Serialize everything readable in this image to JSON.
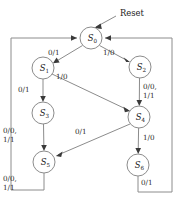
{
  "diagram": {
    "title": "Reset",
    "type": "finite-state-machine",
    "colors": {
      "stroke": "#8c8c8c",
      "arrow": "#3a3a3a",
      "text": "#1a1a1a",
      "background": "#ffffff"
    },
    "reset": {
      "label": "Reset",
      "target": "S0"
    },
    "states": [
      {
        "id": "S0",
        "label": "S",
        "sub": "0",
        "cx": 91,
        "cy": 38,
        "r": 11
      },
      {
        "id": "S1",
        "label": "S",
        "sub": "1",
        "cx": 43,
        "cy": 68,
        "r": 11
      },
      {
        "id": "S2",
        "label": "S",
        "sub": "2",
        "cx": 140,
        "cy": 67,
        "r": 11
      },
      {
        "id": "S3",
        "label": "S",
        "sub": "3",
        "cx": 43,
        "cy": 113,
        "r": 11
      },
      {
        "id": "S4",
        "label": "S",
        "sub": "4",
        "cx": 139,
        "cy": 117,
        "r": 11
      },
      {
        "id": "S5",
        "label": "S",
        "sub": "5",
        "cx": 44,
        "cy": 162,
        "r": 11
      },
      {
        "id": "S6",
        "label": "S",
        "sub": "6",
        "cx": 138,
        "cy": 165,
        "r": 11
      }
    ],
    "transitions": [
      {
        "id": "t0",
        "from": "S0",
        "to": "S1",
        "label": "0/1",
        "lx": 58,
        "ly": 52
      },
      {
        "id": "t1",
        "from": "S0",
        "to": "S2",
        "label": "1/0",
        "lx": 112,
        "ly": 52
      },
      {
        "id": "t2",
        "from": "S1",
        "to": "S3",
        "label": "0/1",
        "lx": 25,
        "ly": 89
      },
      {
        "id": "t3",
        "from": "S1",
        "to": "S4",
        "label": "1/0",
        "lx": 63,
        "ly": 74
      },
      {
        "id": "t4",
        "from": "S2",
        "to": "S4",
        "label_line1": "0/0,",
        "label_line2": "1/1",
        "lx": 145,
        "ly": 85
      },
      {
        "id": "t5",
        "from": "S3",
        "to": "S5",
        "label_line1": "0/0,",
        "label_line2": "1/1",
        "lx": 7,
        "ly": 130
      },
      {
        "id": "t6",
        "from": "S4",
        "to": "S5",
        "label": "0/1",
        "lx": 83,
        "ly": 131
      },
      {
        "id": "t7",
        "from": "S4",
        "to": "S6",
        "label": "1/0",
        "lx": 145,
        "ly": 137
      },
      {
        "id": "t8",
        "from": "S5",
        "to": "S0",
        "label_line1": "0/0,",
        "label_line2": "1/1",
        "lx": 7,
        "ly": 178
      },
      {
        "id": "t9",
        "from": "S6",
        "to": "S0",
        "label": "0/1",
        "lx": 145,
        "ly": 182
      }
    ]
  }
}
